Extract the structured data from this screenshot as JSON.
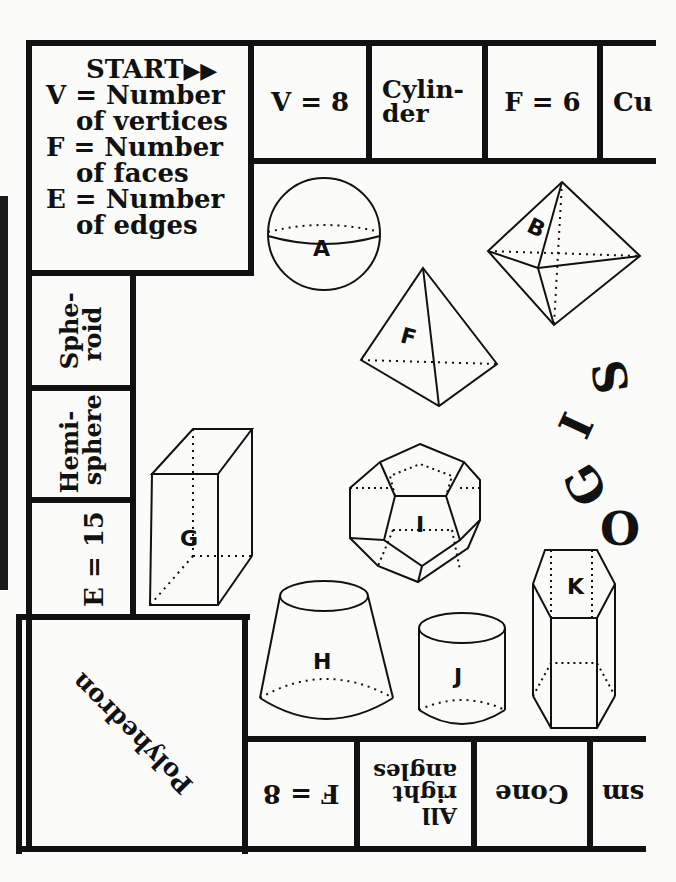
{
  "board": {
    "title": "Geometry board game",
    "start_square": {
      "heading": "START",
      "arrows": "double-right-arrow",
      "legend": [
        {
          "line1": "V = Number",
          "line2": "of vertices"
        },
        {
          "line1": "F = Number",
          "line2": "of faces"
        },
        {
          "line1": "E = Number",
          "line2": "of edges"
        }
      ]
    },
    "top_row": [
      {
        "label": "V = 8"
      },
      {
        "label": "Cylin-\nder",
        "line1": "Cylin-",
        "line2": "der"
      },
      {
        "label": "F = 6"
      },
      {
        "label": "Cu"
      }
    ],
    "left_column": [
      {
        "line1": "Sphe-",
        "line2": "roid"
      },
      {
        "line1": "Hemi-",
        "line2": "sphere"
      },
      {
        "label": "E = 15"
      }
    ],
    "corner_square": {
      "label": "Polyhedron"
    },
    "bottom_row": [
      {
        "label": "F = 8"
      },
      {
        "line1": "All",
        "line2": "right",
        "line3": "angles"
      },
      {
        "label": "Cone"
      },
      {
        "label": "sm"
      }
    ],
    "center_word": {
      "letters": [
        "S",
        "I",
        "G",
        "O"
      ],
      "reading": "GOIS (decorative, rotated letters)"
    }
  },
  "shapes": [
    {
      "id": "A",
      "kind": "sphere"
    },
    {
      "id": "B",
      "kind": "octahedron"
    },
    {
      "id": "F",
      "kind": "tetrahedron"
    },
    {
      "id": "G",
      "kind": "rectangular-prism"
    },
    {
      "id": "I",
      "kind": "dodecahedron"
    },
    {
      "id": "H",
      "kind": "frustum-of-cone"
    },
    {
      "id": "J",
      "kind": "cylinder"
    },
    {
      "id": "K",
      "kind": "hexagonal-prism"
    }
  ],
  "colors": {
    "ink": "#111111",
    "paper": "#fbfbf9"
  }
}
